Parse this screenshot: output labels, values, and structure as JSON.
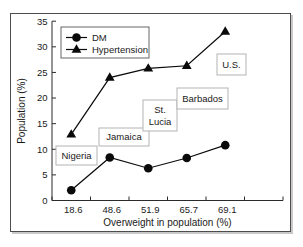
{
  "figure": {
    "background": "#ffffff",
    "border_color": "#4d4d4d",
    "text_color": "#1a1a1a",
    "axis_color": "#2b2b2b",
    "series_color": "#0a0a0a",
    "annotation_border_color": "#b3b3b3",
    "legend_border_color": "#666666"
  },
  "chart_data": {
    "type": "line",
    "title": "",
    "xlabel": "Overweight in population (%)",
    "ylabel": "Population (%)",
    "x_categories": [
      "18.6",
      "48.6",
      "51.9",
      "65.7",
      "69.1"
    ],
    "ylim": [
      0,
      35
    ],
    "yticks": [
      0,
      5,
      10,
      15,
      20,
      25,
      30,
      35
    ],
    "grid": false,
    "legend_position": "top-left",
    "legend_entries": [
      "DM",
      "Hypertension"
    ],
    "series": [
      {
        "name": "DM",
        "marker": "circle",
        "values": [
          2.0,
          8.4,
          6.3,
          8.3,
          10.8
        ]
      },
      {
        "name": "Hypertension",
        "marker": "triangle",
        "values": [
          12.9,
          24.0,
          25.8,
          26.3,
          33.0
        ]
      }
    ],
    "annotations": [
      {
        "label": "Nigeria",
        "lines": [
          "Nigeria"
        ]
      },
      {
        "label": "Jamaica",
        "lines": [
          "Jamaica"
        ]
      },
      {
        "label": "St. Lucia",
        "lines": [
          "St.",
          "Lucia"
        ]
      },
      {
        "label": "Barbados",
        "lines": [
          "Barbados"
        ]
      },
      {
        "label": "U.S.",
        "lines": [
          "U.S."
        ]
      }
    ]
  }
}
